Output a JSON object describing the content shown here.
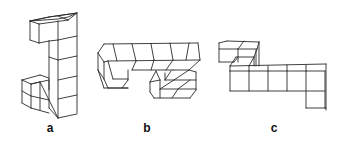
{
  "figure": {
    "stroke_color": "#2a2a2a",
    "background": "#ffffff",
    "panels": [
      {
        "id": "a",
        "label": "a",
        "label_position": {
          "x": 50,
          "y": 124
        },
        "shape": "vertical column of 5 cubes with one cube attached at top-left and a 2x2 block at bottom-left"
      },
      {
        "id": "b",
        "label": "b",
        "label_position": {
          "x": 147,
          "y": 124
        },
        "shape": "horizontal row of 5 cubes with a cube hanging down on the left and an L-shaped 3-cube cluster below on the right"
      },
      {
        "id": "c",
        "label": "c",
        "label_position": {
          "x": 274,
          "y": 124
        },
        "shape": "horizontal row of 5 cubes with a 2-cube stack at top-left behind and one cube dropping down at the right end"
      }
    ]
  }
}
